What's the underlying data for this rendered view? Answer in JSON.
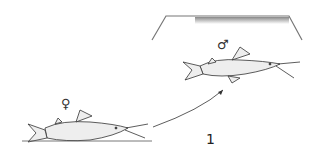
{
  "figure": {
    "label": "1",
    "male_symbol": "♂",
    "female_symbol": "♀",
    "colors": {
      "ink": "#333333",
      "background": "#ffffff",
      "surface_shading": "#999999"
    }
  },
  "elements": {
    "tank_surface": "aquarium-water-surface",
    "male_fish": "catfish-male-at-surface",
    "female_fish": "catfish-female-on-bottom",
    "arrow": "curved-arrow-female-to-male"
  }
}
